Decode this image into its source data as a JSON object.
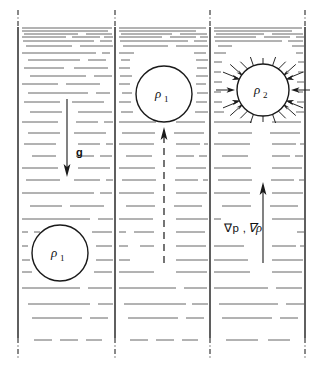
{
  "figure": {
    "kind": "scientific-diagram",
    "title": "",
    "background_color": "#ffffff",
    "line_color": "#1a1a1a",
    "hatch_color": "#555555",
    "width": 323,
    "height": 375
  },
  "panels": [
    {
      "id": "panel-left",
      "index": 1,
      "x": 18,
      "width": 97,
      "blob": {
        "label_rho": "ρ",
        "label_sub": "1",
        "cx": 60,
        "cy": 253,
        "r": 28
      },
      "arrow": {
        "name": "gravity-arrow",
        "label": "g",
        "direction": "down",
        "x": 67,
        "y_start": 99,
        "y_end": 176,
        "label_x": 76,
        "label_y": 152
      }
    },
    {
      "id": "panel-middle",
      "index": 2,
      "x": 115,
      "width": 95,
      "blob": {
        "label_rho": "ρ",
        "label_sub": "1",
        "cx": 164,
        "cy": 94,
        "r": 28
      },
      "arrow": {
        "name": "buoyancy-dashed-arrow",
        "label": "",
        "direction": "up",
        "x": 164,
        "y_start": 263,
        "y_end": 128
      }
    },
    {
      "id": "panel-right",
      "index": 3,
      "x": 210,
      "width": 95,
      "blob": {
        "label_rho": "ρ",
        "label_sub": "2",
        "cx": 263,
        "cy": 90,
        "r": 26
      },
      "arrow": {
        "name": "pressure-gradient-arrow",
        "label_nabla_p": "∇p ,",
        "label_nabla_rho": "∇ρ",
        "direction": "up",
        "x": 263,
        "y_start": 263,
        "y_end": 183,
        "label_x": 226,
        "label_y": 228
      },
      "radial_arrows": {
        "name": "inward-pressure-arrows",
        "count": 16,
        "inner_gap": 5,
        "length": 16
      }
    }
  ],
  "labels": {
    "gravity": "g",
    "rho_1": "ρ",
    "rho_1_sub": "1",
    "rho_2": "ρ",
    "rho_2_sub": "2",
    "grad_p": "∇p ,",
    "grad_rho": "∇ρ"
  }
}
